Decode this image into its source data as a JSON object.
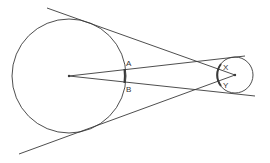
{
  "diagram": {
    "stroke_color": "#3a3a3a",
    "background": "#ffffff",
    "large_circle": {
      "cx": 69,
      "cy": 76,
      "r": 57
    },
    "small_circle": {
      "cx": 235,
      "cy": 75,
      "r": 18
    },
    "labels": {
      "A": "A",
      "B": "B",
      "X": "X",
      "Y": "Y"
    }
  }
}
